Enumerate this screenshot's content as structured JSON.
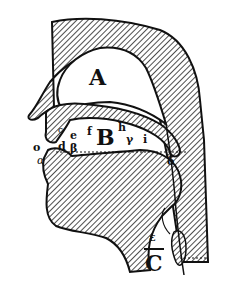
{
  "diagram": {
    "colors": {
      "ink": "#111111",
      "background": "#ffffff",
      "hatch": "#222222"
    },
    "regions": [
      {
        "id": "A",
        "label": "A",
        "meaning": "nasal cavity"
      },
      {
        "id": "B",
        "label": "B",
        "meaning": "oral cavity"
      },
      {
        "id": "C",
        "label": "C",
        "meaning": "larynx / glottis"
      }
    ],
    "points": [
      {
        "label": "o"
      },
      {
        "label": "c"
      },
      {
        "label": "d"
      },
      {
        "label": "β"
      },
      {
        "label": "e"
      },
      {
        "label": "f"
      },
      {
        "label": "h"
      },
      {
        "label": "γ"
      },
      {
        "label": "i"
      },
      {
        "label": "α"
      },
      {
        "label": "δ"
      },
      {
        "label": "ε"
      }
    ]
  }
}
